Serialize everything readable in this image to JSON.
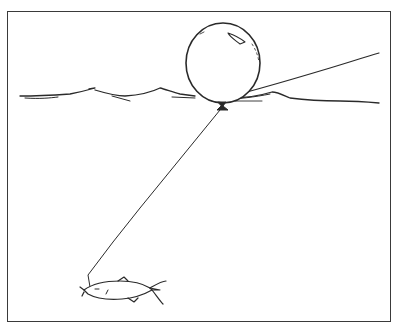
{
  "figure": {
    "elements": {
      "frame": "rectangular border",
      "balloon": "float balloon at water surface",
      "knot": "tie knot at bottom of balloon",
      "surface_line": "rope line extending up-right from balloon",
      "water_surface": "wavy water line",
      "tether": "line from balloon down to fish",
      "fish": "hooked fish at end of line"
    },
    "colors": {
      "ink": "#2a2a2a",
      "background": "#ffffff"
    }
  }
}
